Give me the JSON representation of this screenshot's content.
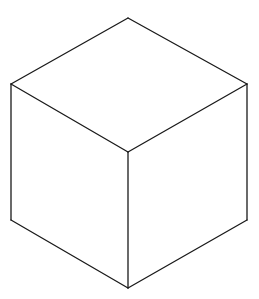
{
  "diagram": {
    "type": "isometric-cube-line-drawing",
    "stroke_color": "#1a1a1a",
    "background_color": "#ffffff",
    "vertices": {
      "top": [
        128,
        18
      ],
      "top_left": [
        11,
        84
      ],
      "top_right": [
        247,
        84
      ],
      "center": [
        128,
        152
      ],
      "bottom_left": [
        11,
        220
      ],
      "bottom_right": [
        247,
        220
      ],
      "bottom": [
        128,
        288
      ]
    },
    "faces": [
      {
        "name": "top",
        "points": "128,18 247,84 128,152 11,84"
      },
      {
        "name": "left",
        "points": "11,84 128,152 128,288 11,220"
      },
      {
        "name": "right",
        "points": "128,152 247,84 247,220 128,288"
      }
    ],
    "edges": [
      {
        "name": "top-left-upper",
        "x1": 128,
        "y1": 18,
        "x2": 11,
        "y2": 84
      },
      {
        "name": "top-right-upper",
        "x1": 128,
        "y1": 18,
        "x2": 247,
        "y2": 84
      },
      {
        "name": "top-left-lower",
        "x1": 11,
        "y1": 84,
        "x2": 128,
        "y2": 152
      },
      {
        "name": "top-right-lower",
        "x1": 247,
        "y1": 84,
        "x2": 128,
        "y2": 152
      },
      {
        "name": "left-vertical",
        "x1": 11,
        "y1": 84,
        "x2": 11,
        "y2": 220
      },
      {
        "name": "center-vertical",
        "x1": 128,
        "y1": 152,
        "x2": 128,
        "y2": 288
      },
      {
        "name": "right-vertical",
        "x1": 247,
        "y1": 84,
        "x2": 247,
        "y2": 220
      },
      {
        "name": "bottom-left",
        "x1": 11,
        "y1": 220,
        "x2": 128,
        "y2": 288
      },
      {
        "name": "bottom-right",
        "x1": 247,
        "y1": 220,
        "x2": 128,
        "y2": 288
      }
    ]
  }
}
